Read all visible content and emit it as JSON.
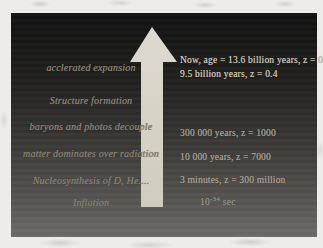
{
  "figure": {
    "description": "Cosmic history timeline slide with upward arrow",
    "colors": {
      "page_background": "#edece8",
      "slide_top": "#121212",
      "slide_bottom": "#6e6c69",
      "arrow_fill": "#d7d3c7",
      "left_text": "#8b8476",
      "right_text_bright": "#cdc7b7",
      "right_text_dim": "#a9a296"
    },
    "arrow": {
      "icon": "up-arrow-icon",
      "direction": "up"
    },
    "left_labels": [
      {
        "text": "acclerated expansion"
      },
      {
        "text": "Structure formation"
      },
      {
        "text": "baryons and photos decouple"
      },
      {
        "text": "matter dominates over radiation"
      },
      {
        "text": "Nucleosynthesis of D, He...."
      },
      {
        "text": "Inflation"
      }
    ],
    "right_labels": [
      {
        "text": "Now, age = 13.6 billion years, z = 0"
      },
      {
        "text": "9.5 billion years, z = 0.4"
      },
      {
        "text": "300 000 years, z = 1000"
      },
      {
        "text": "10 000 years, z = 7000"
      },
      {
        "text": "3 minutes, z = 300 million"
      }
    ],
    "planck_time": {
      "base": "10",
      "exponent": "-34",
      "unit": "sec"
    }
  }
}
